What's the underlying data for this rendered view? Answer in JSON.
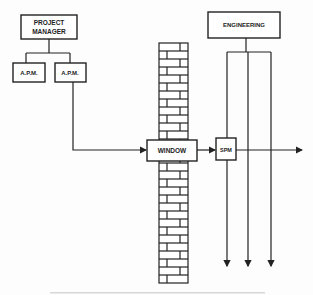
{
  "diagram": {
    "nodes": {
      "project_manager": {
        "line1": "PROJECT",
        "line2": "MANAGER"
      },
      "apm_left": {
        "label": "A.P.M."
      },
      "apm_right": {
        "label": "A.P.M."
      },
      "window": {
        "label": "WINDOW"
      },
      "engineering": {
        "label": "ENGINEERING"
      },
      "spm": {
        "label": "SPM"
      }
    },
    "wall": {
      "name": "brick wall"
    },
    "colors": {
      "line": "#222222",
      "background": "#fdfdfd"
    }
  }
}
